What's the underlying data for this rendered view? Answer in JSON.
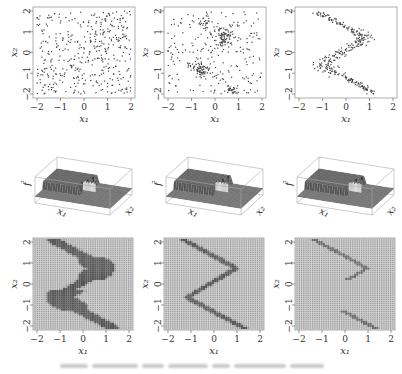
{
  "figure": {
    "rows": [
      {
        "type": "scatter",
        "panels": [
          {
            "id": "scatter-uniform",
            "pattern": "uniform",
            "n_points": 420
          },
          {
            "id": "scatter-mixed",
            "pattern": "mixed",
            "n_points": 380
          },
          {
            "id": "scatter-curve",
            "pattern": "curve",
            "n_points": 320
          }
        ]
      },
      {
        "type": "surface3d",
        "panels": [
          {
            "id": "surface-1",
            "variant": 1
          },
          {
            "id": "surface-2",
            "variant": 2
          },
          {
            "id": "surface-3",
            "variant": 3
          }
        ]
      },
      {
        "type": "grid-heatmap",
        "panels": [
          {
            "id": "grid-1",
            "variant": "thick"
          },
          {
            "id": "grid-2",
            "variant": "thin"
          },
          {
            "id": "grid-3",
            "variant": "faint"
          }
        ]
      }
    ],
    "axes": {
      "xlabel": "x₁",
      "ylabel": "x₂",
      "zlabel": "f̂",
      "xticks": [
        "−2",
        "−1",
        "0",
        "1",
        "2"
      ],
      "yticks": [
        "−2",
        "−1",
        "0",
        "1",
        "2"
      ],
      "xlim": [
        -2,
        2
      ],
      "ylim": [
        -2,
        2
      ]
    },
    "caption": {
      "legible": false,
      "note": "caption text is blurred in the screenshot"
    },
    "colors": {
      "point": "#444444",
      "frame": "#999999",
      "surface_dark": "#3a3a3a",
      "surface_light": "#bbbbbb",
      "grid_bg": "#9a9a9a",
      "grid_band": "#555555"
    }
  },
  "chart_data": [
    {
      "type": "scatter",
      "title": "",
      "xlabel": "x₁",
      "ylabel": "x₂",
      "xlim": [
        -2,
        2
      ],
      "ylim": [
        -2,
        2
      ],
      "description": "uniformly scattered points over [-2,2]^2"
    },
    {
      "type": "scatter",
      "title": "",
      "xlabel": "x₁",
      "ylabel": "x₂",
      "xlim": [
        -2,
        2
      ],
      "ylim": [
        -2,
        2
      ],
      "description": "background uniform points plus clusters along a sideways V-shaped curve (clusters near (0.3,0.8), (-0.6,-0.8), (0.7,-1.8))"
    },
    {
      "type": "scatter",
      "title": "",
      "xlabel": "x₁",
      "ylabel": "x₂",
      "xlim": [
        -2,
        2
      ],
      "ylim": [
        -2,
        2
      ],
      "description": "points concentrated along a sideways V curve: from (-1.3,2) to (0.9,0.7) to (-1.1,-0.6) to (1.3,-2)"
    },
    {
      "type": "surface",
      "xlabel": "x₁",
      "ylabel": "x₂",
      "zlabel": "f̂",
      "description": "3D step surface estimate, variant 1"
    },
    {
      "type": "surface",
      "xlabel": "x₁",
      "ylabel": "x₂",
      "zlabel": "f̂",
      "description": "3D step surface estimate, variant 2"
    },
    {
      "type": "surface",
      "xlabel": "x₁",
      "ylabel": "x₂",
      "zlabel": "f̂",
      "description": "3D step surface estimate, variant 3"
    },
    {
      "type": "heatmap",
      "xlabel": "x₁",
      "ylabel": "x₂",
      "xlim": [
        -2,
        2
      ],
      "ylim": [
        -2,
        2
      ],
      "description": "gridded image with thick dark sideways-V band"
    },
    {
      "type": "heatmap",
      "xlabel": "x₁",
      "ylabel": "x₂",
      "xlim": [
        -2,
        2
      ],
      "ylim": [
        -2,
        2
      ],
      "description": "gridded image with thin sideways-V band"
    },
    {
      "type": "heatmap",
      "xlabel": "x₁",
      "ylabel": "x₂",
      "xlim": [
        -2,
        2
      ],
      "ylim": [
        -2,
        2
      ],
      "description": "gridded image with faint diagonal band"
    }
  ]
}
